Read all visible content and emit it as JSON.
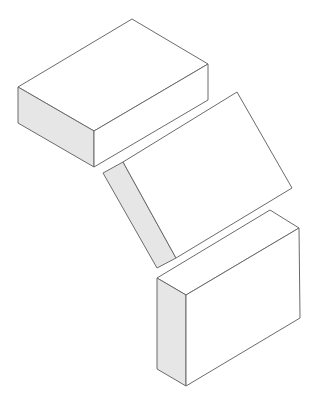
{
  "diagram": {
    "width": 316,
    "height": 413,
    "colors": {
      "background": "#ffffff",
      "stroke": "#6b6b6b",
      "face_white": "#ffffff",
      "face_gray": "#e6e6e6"
    },
    "stroke_width": 1,
    "shapes": [
      {
        "name": "top-box",
        "faces": [
          {
            "name": "top-face",
            "fill": "white",
            "points": "18,87 132,19 208,64 94,131"
          },
          {
            "name": "left-side-face",
            "fill": "gray",
            "points": "18,87 94,131 94,167 18,123"
          },
          {
            "name": "front-face",
            "fill": "white",
            "points": "94,131 208,64 208,100 94,167"
          }
        ]
      },
      {
        "name": "tilted-middle-panel",
        "faces": [
          {
            "name": "edge-face",
            "fill": "gray",
            "points": "103,173 123,162 176,258 157,268"
          },
          {
            "name": "main-face",
            "fill": "white",
            "points": "123,162 237,92 292,188 176,258"
          }
        ]
      },
      {
        "name": "bottom-box",
        "faces": [
          {
            "name": "top-face",
            "fill": "white",
            "points": "157,278 270,210 299,228 186,295"
          },
          {
            "name": "left-side-face",
            "fill": "gray",
            "points": "157,278 186,295 186,386 157,369"
          },
          {
            "name": "front-face",
            "fill": "white",
            "points": "186,295 299,228 300,318 186,386"
          }
        ]
      }
    ]
  }
}
